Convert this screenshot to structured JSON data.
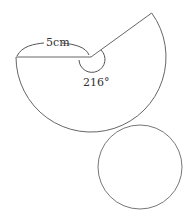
{
  "diagram": {
    "type": "cone-net",
    "sector": {
      "radius_label": "5cm",
      "angle_label": "216°"
    },
    "colors": {
      "stroke": "#555555",
      "text": "#333333"
    }
  }
}
